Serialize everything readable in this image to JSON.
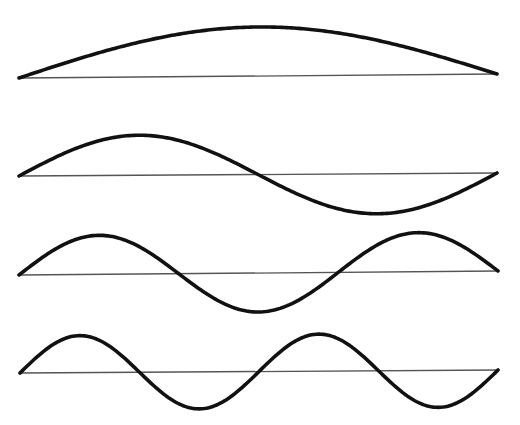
{
  "diagram": {
    "colors": {
      "wave": "#111111",
      "baseline": "#555555",
      "background": "#ffffff"
    },
    "harmonics": [
      {
        "id": "harmonic-1",
        "label": "1st harmonic",
        "half_wavelengths": 1,
        "x_start": 19,
        "x_end": 497,
        "y_start": 78,
        "y_end": 74,
        "amplitude": 49
      },
      {
        "id": "harmonic-2",
        "label": "2nd harmonic",
        "half_wavelengths": 2,
        "x_start": 19,
        "x_end": 497,
        "y_start": 176,
        "y_end": 173,
        "amplitude": 40
      },
      {
        "id": "harmonic-3",
        "label": "3rd harmonic",
        "half_wavelengths": 3,
        "x_start": 19,
        "x_end": 498,
        "y_start": 275,
        "y_end": 271,
        "amplitude": 39
      },
      {
        "id": "harmonic-4",
        "label": "4th harmonic",
        "half_wavelengths": 4,
        "x_start": 20,
        "x_end": 498,
        "y_start": 373,
        "y_end": 370,
        "amplitude": 37
      }
    ]
  }
}
